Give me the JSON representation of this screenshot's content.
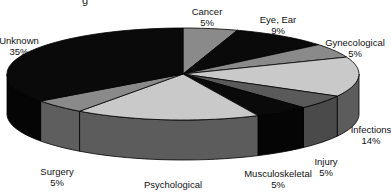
{
  "chart_data": {
    "type": "pie",
    "style": "3d-pie",
    "title": "",
    "categories": [
      "Cancer",
      "Eye, Ear",
      "Gynecological",
      "Infections",
      "Injury",
      "Musculoskeletal",
      "Psychological",
      "Surgery",
      "Unknown"
    ],
    "values": [
      5,
      9,
      5,
      14,
      5,
      5,
      17,
      5,
      35
    ],
    "units": "%",
    "legend": "none (data labels on slices)",
    "colors": [
      "#8a8a8a",
      "#0a0a0a",
      "#8a8a8a",
      "#c9c9c9",
      "#5a5a5a",
      "#0a0a0a",
      "#c9c9c9",
      "#8a8a8a",
      "#0a0a0a"
    ],
    "side_colors": [
      "#6a6a6a",
      "#050505",
      "#6a6a6a",
      "#5c5c5c",
      "#4a4a4a",
      "#050505",
      "#5c5c5c",
      "#5e5e5e",
      "#050505"
    ],
    "start_angle_deg": 0,
    "direction": "clockwise"
  },
  "labels": [
    {
      "name": "Cancer",
      "pct": "5%",
      "x": 207,
      "y": 6
    },
    {
      "name": "Eye, Ear",
      "pct": "9%",
      "x": 278,
      "y": 14
    },
    {
      "name": "Gynecological",
      "pct": "5%",
      "x": 355,
      "y": 37
    },
    {
      "name": "Infections",
      "pct": "14%",
      "x": 371,
      "y": 124
    },
    {
      "name": "Injury",
      "pct": "5%",
      "x": 326,
      "y": 156
    },
    {
      "name": "Musculoskeletal",
      "pct": "5%",
      "x": 278,
      "y": 168
    },
    {
      "name": "Psychological",
      "pct": "17%",
      "x": 173,
      "y": 179
    },
    {
      "name": "Surgery",
      "pct": "5%",
      "x": 57,
      "y": 166
    },
    {
      "name": "Unknown",
      "pct": "35%",
      "x": 19,
      "y": 35
    }
  ],
  "title_fragment": "g"
}
